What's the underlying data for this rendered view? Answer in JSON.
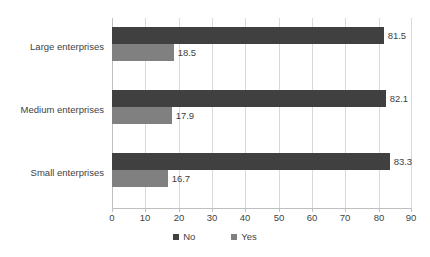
{
  "chart_data": {
    "type": "bar",
    "orientation": "horizontal",
    "title": "",
    "subtitle": "",
    "xlabel": "",
    "ylabel": "",
    "categories": [
      "Large enterprises",
      "Medium enterprises",
      "Small enterprises"
    ],
    "series": [
      {
        "name": "No",
        "color": "#404040",
        "values": [
          81.5,
          82.1,
          83.3
        ],
        "labels": [
          "81.5",
          "82.1",
          "83.3"
        ]
      },
      {
        "name": "Yes",
        "color": "#808080",
        "values": [
          18.5,
          17.9,
          16.7
        ],
        "labels": [
          "18.5",
          "17.9",
          "16.7"
        ]
      }
    ],
    "xlim": [
      0,
      90
    ],
    "xticks": [
      0,
      10,
      20,
      30,
      40,
      50,
      60,
      70,
      80,
      90
    ],
    "xtick_labels": [
      "0",
      "10",
      "20",
      "30",
      "40",
      "50",
      "60",
      "70",
      "80",
      "90"
    ],
    "grid": true,
    "grid_axis": "x",
    "legend_position": "bottom",
    "legend": [
      "No",
      "Yes"
    ]
  },
  "axis": {
    "ticks": [
      {
        "label": "0"
      },
      {
        "label": "10"
      },
      {
        "label": "20"
      },
      {
        "label": "30"
      },
      {
        "label": "40"
      },
      {
        "label": "50"
      },
      {
        "label": "60"
      },
      {
        "label": "70"
      },
      {
        "label": "80"
      },
      {
        "label": "90"
      }
    ]
  },
  "groups": [
    {
      "category": "Large enterprises",
      "no_value": "81.5",
      "yes_value": "18.5"
    },
    {
      "category": "Medium enterprises",
      "no_value": "82.1",
      "yes_value": "17.9"
    },
    {
      "category": "Small enterprises",
      "no_value": "83.3",
      "yes_value": "16.7"
    }
  ],
  "legend": {
    "items": [
      {
        "label": "No",
        "color": "#404040"
      },
      {
        "label": "Yes",
        "color": "#808080"
      }
    ]
  },
  "colors": {
    "series_no": "#404040",
    "series_yes": "#808080",
    "gridline": "#d9d9d9",
    "axis": "#bfbfbf",
    "text": "#3f3f3f",
    "background": "#ffffff"
  }
}
